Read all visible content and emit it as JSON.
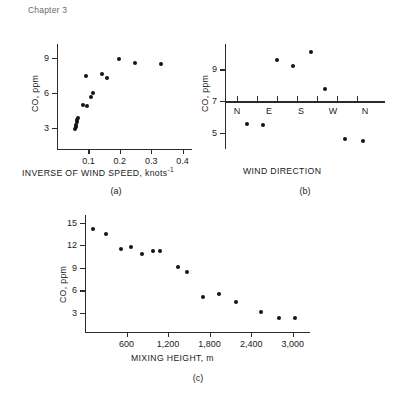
{
  "header": {
    "running_head": "Chapter 3"
  },
  "figure": {
    "captions": {
      "a": "(a)",
      "b": "(b)",
      "c": "(c)"
    }
  },
  "chart_data": [
    {
      "id": "a",
      "type": "scatter",
      "title": "",
      "caption": "(a)",
      "xlabel": "INVERSE OF WIND SPEED, knots",
      "xlabel_superscript": "-1",
      "ylabel": "CO, ppm",
      "xlim": [
        0.0,
        0.43
      ],
      "ylim": [
        1.2,
        10.2
      ],
      "xticks": [
        0.1,
        0.2,
        0.3,
        0.4
      ],
      "xticklabels": [
        "0.1",
        "0.2",
        "0.3",
        "0.4"
      ],
      "yticks": [
        3,
        6,
        9
      ],
      "yticklabels": [
        "3",
        "6",
        "9"
      ],
      "grid": false,
      "legend": false,
      "points": [
        {
          "x": 0.057,
          "y": 2.9
        },
        {
          "x": 0.059,
          "y": 3.1
        },
        {
          "x": 0.061,
          "y": 3.3
        },
        {
          "x": 0.063,
          "y": 3.5
        },
        {
          "x": 0.065,
          "y": 3.7
        },
        {
          "x": 0.067,
          "y": 3.9
        },
        {
          "x": 0.083,
          "y": 5.0
        },
        {
          "x": 0.095,
          "y": 4.9
        },
        {
          "x": 0.092,
          "y": 7.5
        },
        {
          "x": 0.108,
          "y": 5.7
        },
        {
          "x": 0.115,
          "y": 6.0
        },
        {
          "x": 0.143,
          "y": 7.6
        },
        {
          "x": 0.158,
          "y": 7.3
        },
        {
          "x": 0.198,
          "y": 8.9
        },
        {
          "x": 0.248,
          "y": 8.6
        },
        {
          "x": 0.33,
          "y": 8.5
        }
      ]
    },
    {
      "id": "b",
      "type": "scatter",
      "title": "",
      "caption": "(b)",
      "xlabel": "WIND DIRECTION",
      "ylabel": "CO, ppm",
      "xlim": [
        0,
        8
      ],
      "ylim": [
        4.0,
        10.6
      ],
      "xticks": [
        0.6,
        1.6,
        2.6,
        3.6,
        4.6,
        5.6,
        6.6
      ],
      "xticklabels": [
        "N",
        "",
        "E",
        "",
        "S",
        "",
        "W"
      ],
      "direction_labels": [
        {
          "x": 0.6,
          "label": "N"
        },
        {
          "x": 2.2,
          "label": "E"
        },
        {
          "x": 3.8,
          "label": "S"
        },
        {
          "x": 5.4,
          "label": "W"
        },
        {
          "x": 7.0,
          "label": "N"
        }
      ],
      "axis_crossing_y": 7,
      "yticks": [
        5,
        7,
        9
      ],
      "yticklabels": [
        "5",
        "7",
        "9"
      ],
      "grid": false,
      "legend": false,
      "points": [
        {
          "x": 1.1,
          "y": 5.6
        },
        {
          "x": 1.9,
          "y": 5.5
        },
        {
          "x": 2.6,
          "y": 9.6
        },
        {
          "x": 3.4,
          "y": 9.2
        },
        {
          "x": 4.3,
          "y": 10.1
        },
        {
          "x": 5.0,
          "y": 7.8
        },
        {
          "x": 6.0,
          "y": 4.6
        },
        {
          "x": 6.9,
          "y": 4.5
        }
      ]
    },
    {
      "id": "c",
      "type": "scatter",
      "title": "",
      "caption": "(c)",
      "xlabel": "MIXING HEIGHT, m",
      "ylabel": "CO, ppm",
      "xlim": [
        0,
        3250
      ],
      "ylim": [
        0.5,
        16
      ],
      "xticks": [
        600,
        1200,
        1800,
        2400,
        3000
      ],
      "xticklabels": [
        "600",
        "1,200",
        "1,800",
        "2,400",
        "3,000"
      ],
      "yticks": [
        3,
        6,
        9,
        12,
        15
      ],
      "yticklabels": [
        "3",
        "6",
        "9",
        "12",
        "15"
      ],
      "grid": false,
      "legend": false,
      "points": [
        {
          "x": 120,
          "y": 14.1
        },
        {
          "x": 300,
          "y": 13.5
        },
        {
          "x": 520,
          "y": 11.5
        },
        {
          "x": 660,
          "y": 11.8
        },
        {
          "x": 820,
          "y": 10.8
        },
        {
          "x": 980,
          "y": 11.2
        },
        {
          "x": 1090,
          "y": 11.2
        },
        {
          "x": 1340,
          "y": 9.1
        },
        {
          "x": 1480,
          "y": 8.5
        },
        {
          "x": 1700,
          "y": 5.2
        },
        {
          "x": 1930,
          "y": 5.5
        },
        {
          "x": 2180,
          "y": 4.5
        },
        {
          "x": 2540,
          "y": 3.1
        },
        {
          "x": 2800,
          "y": 2.4
        },
        {
          "x": 3030,
          "y": 2.3
        }
      ]
    }
  ]
}
